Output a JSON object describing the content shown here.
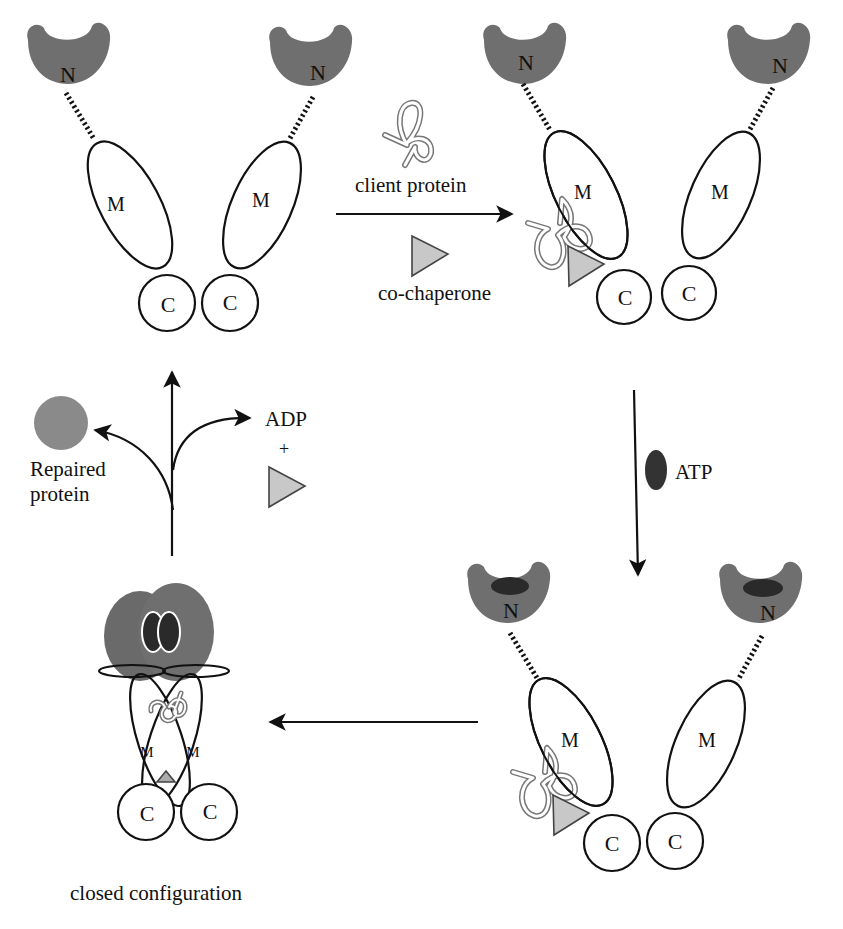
{
  "diagram": {
    "domain_labels": {
      "n": "N",
      "m": "M",
      "c": "C"
    },
    "steps": {
      "step1_add": {
        "client": "client protein",
        "cochaperone": "co-chaperone"
      },
      "step2_add": {
        "atp": "ATP"
      },
      "step4_release": {
        "product": "Repaired",
        "product_line2": "protein",
        "adp": "ADP",
        "plus": "+"
      }
    },
    "closed_label": "closed configuration",
    "colors": {
      "n_domain": "#6f6f6f",
      "atp": "#333333",
      "repaired_protein": "#8a8a8a",
      "cochaperone": "#c8c8c8",
      "outline": "#111111"
    }
  }
}
